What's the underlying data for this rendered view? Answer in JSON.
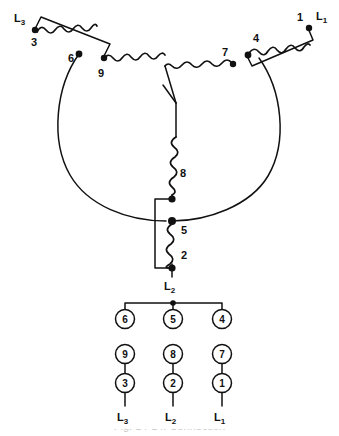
{
  "diagram": {
    "type": "wye-connected 9-lead motor winding schematic",
    "line_labels": {
      "l1": "L",
      "l1_sub": "1",
      "l2": "L",
      "l2_sub": "2",
      "l3": "L",
      "l3_sub": "3"
    },
    "winding_terminals": {
      "t1": "1",
      "t2": "2",
      "t3": "3",
      "t4": "4",
      "t5": "5",
      "t6": "6",
      "t7": "7",
      "t8": "8",
      "t9": "9"
    }
  },
  "terminal_board": {
    "row_top": [
      "6",
      "5",
      "4"
    ],
    "row_middle": [
      "9",
      "8",
      "7"
    ],
    "row_bottom": [
      "3",
      "2",
      "1"
    ],
    "lead_labels": [
      {
        "text": "L",
        "sub": "3"
      },
      {
        "text": "L",
        "sub": "2"
      },
      {
        "text": "L",
        "sub": "1"
      }
    ]
  },
  "caption": {
    "text": "Fig. 14-14. Connection"
  },
  "colors": {
    "ink": "#111111",
    "background": "#ffffff"
  }
}
